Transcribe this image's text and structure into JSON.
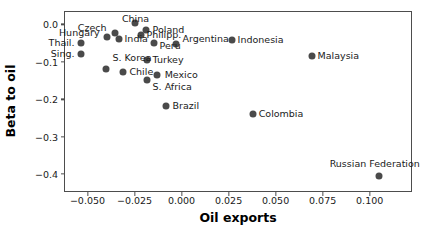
{
  "chart_data": {
    "type": "scatter",
    "title": "",
    "xlabel": "Oil exports",
    "ylabel": "Beta to oil",
    "xlim": [
      -0.0625,
      0.1225
    ],
    "ylim": [
      -0.4475,
      0.0355
    ],
    "grid": false,
    "legend": null,
    "marker_color": "#4a4a4a",
    "xticks": [
      -0.05,
      -0.025,
      0.0,
      0.025,
      0.05,
      0.075,
      0.1
    ],
    "xtick_labels": [
      "−0.050",
      "−0.025",
      "0.000",
      "0.025",
      "0.050",
      "0.075",
      "0.100"
    ],
    "yticks": [
      0.0,
      -0.1,
      -0.2,
      -0.3,
      -0.4
    ],
    "ytick_labels": [
      "0.0",
      "−0.1",
      "−0.2",
      "−0.3",
      "−0.4"
    ],
    "points": [
      {
        "label": "China",
        "x": -0.0245,
        "y": 0.0026,
        "lx": -0.0245,
        "ly": 0.0154,
        "anchor": "c"
      },
      {
        "label": "Czech",
        "x": -0.0356,
        "y": -0.0231,
        "lx": -0.0399,
        "ly": -0.0103,
        "anchor": "r"
      },
      {
        "label": "Poland",
        "x": -0.0191,
        "y": -0.0154,
        "lx": -0.0154,
        "ly": -0.0154,
        "anchor": "l"
      },
      {
        "label": "Hungary",
        "x": -0.0399,
        "y": -0.0333,
        "lx": -0.0436,
        "ly": -0.0231,
        "anchor": "r"
      },
      {
        "label": "Philipp.",
        "x": -0.0218,
        "y": -0.0282,
        "lx": -0.0186,
        "ly": -0.0282,
        "anchor": "l"
      },
      {
        "label": "India",
        "x": -0.033,
        "y": -0.0385,
        "lx": -0.0303,
        "ly": -0.0385,
        "anchor": "l"
      },
      {
        "label": "Thail.",
        "x": -0.0532,
        "y": -0.0487,
        "lx": -0.0569,
        "ly": -0.0487,
        "anchor": "r"
      },
      {
        "label": "Argentina",
        "x": -0.0027,
        "y": -0.0513,
        "lx": 0.0005,
        "ly": -0.0385,
        "anchor": "l"
      },
      {
        "label": "Indonesia",
        "x": 0.0266,
        "y": -0.041,
        "lx": 0.0298,
        "ly": -0.041,
        "anchor": "l"
      },
      {
        "label": "Peru",
        "x": -0.0149,
        "y": -0.0487,
        "lx": -0.0117,
        "ly": -0.059,
        "anchor": "l"
      },
      {
        "label": "Sing.",
        "x": -0.0532,
        "y": -0.0795,
        "lx": -0.0569,
        "ly": -0.0795,
        "anchor": "r"
      },
      {
        "label": "Turkey",
        "x": -0.0186,
        "y": -0.0949,
        "lx": -0.0154,
        "ly": -0.0949,
        "anchor": "l"
      },
      {
        "label": "Malaysia",
        "x": 0.0691,
        "y": -0.0846,
        "lx": 0.0723,
        "ly": -0.0846,
        "anchor": "l"
      },
      {
        "label": "S. Korea",
        "x": -0.0404,
        "y": -0.1205,
        "lx": -0.0367,
        "ly": -0.0897,
        "anchor": "l"
      },
      {
        "label": "Chile",
        "x": -0.0314,
        "y": -0.1282,
        "lx": -0.0277,
        "ly": -0.1282,
        "anchor": "l"
      },
      {
        "label": "Mexico",
        "x": -0.0128,
        "y": -0.1359,
        "lx": -0.009,
        "ly": -0.1359,
        "anchor": "l"
      },
      {
        "label": "S. Africa",
        "x": -0.0186,
        "y": -0.1487,
        "lx": -0.0154,
        "ly": -0.1667,
        "anchor": "l"
      },
      {
        "label": "Brazil",
        "x": -0.0085,
        "y": -0.218,
        "lx": -0.0048,
        "ly": -0.218,
        "anchor": "l"
      },
      {
        "label": "Colombia",
        "x": 0.0378,
        "y": -0.2385,
        "lx": 0.041,
        "ly": -0.2385,
        "anchor": "l"
      },
      {
        "label": "Russian Federation",
        "x": 0.1048,
        "y": -0.4051,
        "lx": 0.1027,
        "ly": -0.3718,
        "anchor": "c"
      }
    ]
  }
}
